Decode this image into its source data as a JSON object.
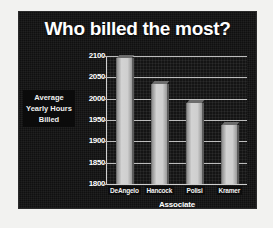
{
  "slide": {
    "title": "Who billed the most?",
    "background_color": "#101010",
    "title_color": "#ffffff"
  },
  "chart_data": {
    "type": "bar",
    "title": "Who billed the most?",
    "xlabel": "Associate",
    "ylabel": "Average Yearly Hours Billed",
    "categories": [
      "DeAngelo",
      "Hancock",
      "Polisi",
      "Kramer"
    ],
    "values": [
      2092,
      2032,
      1987,
      1935
    ],
    "ylim": [
      1800,
      2100
    ],
    "yticks": [
      2100,
      2050,
      2000,
      1950,
      1900,
      1850,
      1800
    ],
    "ytick_labels": [
      "2100",
      "2050",
      "2000",
      "1950",
      "1900",
      "1850",
      "1800"
    ],
    "grid": true,
    "legend": "none",
    "bar_color": "#cfcfcf",
    "gridline_color": "#d8d8d8"
  },
  "axis_label_lines": {
    "y_line1": "Average",
    "y_line2": "Yearly Hours",
    "y_line3": "Billed"
  }
}
